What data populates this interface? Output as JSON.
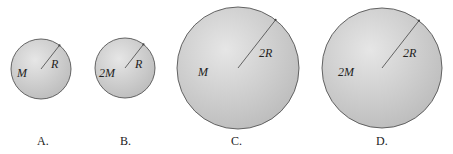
{
  "diagram": {
    "type": "comparison of spheres",
    "colors": {
      "sphere_fill_center": "#e4e4e4",
      "sphere_fill_edge": "#bdbdbd",
      "outline": "#555555",
      "radius_line": "#444444"
    },
    "spheres": [
      {
        "option": "A.",
        "mass_label": "M",
        "radius_label": "R",
        "cx": 41,
        "cy": 69,
        "r": 30,
        "mass_x": 17,
        "mass_y": 77,
        "rad_x": 51,
        "rad_y": 68,
        "option_x": 37,
        "option_y": 145
      },
      {
        "option": "B.",
        "mass_label": "2M",
        "radius_label": "R",
        "cx": 125,
        "cy": 68,
        "r": 30,
        "mass_x": 99,
        "mass_y": 77,
        "rad_x": 135,
        "rad_y": 68,
        "option_x": 120,
        "option_y": 145
      },
      {
        "option": "C.",
        "mass_label": "M",
        "radius_label": "2R",
        "cx": 238,
        "cy": 68,
        "r": 61,
        "mass_x": 198,
        "mass_y": 76,
        "rad_x": 259,
        "rad_y": 57,
        "option_x": 231,
        "option_y": 145
      },
      {
        "option": "D.",
        "mass_label": "2M",
        "radius_label": "2R",
        "cx": 382,
        "cy": 68,
        "r": 60,
        "mass_x": 338,
        "mass_y": 76,
        "rad_x": 403,
        "rad_y": 57,
        "option_x": 376,
        "option_y": 145
      }
    ]
  }
}
